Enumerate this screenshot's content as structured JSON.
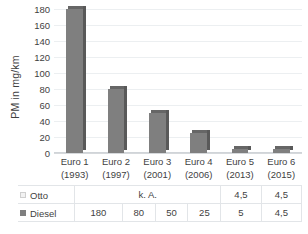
{
  "chart_data": {
    "type": "bar",
    "title": "",
    "subtitle": "",
    "xlabel": "",
    "ylabel": "PM in mg/km",
    "ylim": [
      0,
      180
    ],
    "ytick_step": 20,
    "yticks": [
      180,
      160,
      140,
      120,
      100,
      80,
      60,
      40,
      20,
      0
    ],
    "grid": true,
    "legend_position": "table-row-headers",
    "categories": [
      "Euro 1",
      "Euro 2",
      "Euro 3",
      "Euro 4",
      "Euro 5",
      "Euro 6"
    ],
    "category_years": [
      "(1993)",
      "(1997)",
      "(2001)",
      "(2006)",
      "(2013)",
      "(2015)"
    ],
    "series": [
      {
        "name": "Otto",
        "color": "#f2f2f2",
        "plotted": false,
        "values": [
          null,
          null,
          null,
          null,
          4.5,
          4.5
        ],
        "labels": [
          "k. A.",
          "k. A.",
          "k. A.",
          "k. A.",
          "4,5",
          "4,5"
        ],
        "unknown_label": "k. A.",
        "unknown_span": 4
      },
      {
        "name": "Diesel",
        "color": "#7f7f7f",
        "plotted": true,
        "values": [
          180,
          80,
          50,
          25,
          5,
          4.5
        ],
        "labels": [
          "180",
          "80",
          "50",
          "25",
          "5",
          "4,5"
        ]
      }
    ]
  },
  "axis": {
    "ylabel": "PM in mg/km",
    "ticks": [
      "180",
      "160",
      "140",
      "120",
      "100",
      "80",
      "60",
      "40",
      "20",
      "0"
    ]
  },
  "categories": [
    {
      "name": "Euro 1",
      "year": "(1993)"
    },
    {
      "name": "Euro 2",
      "year": "(1997)"
    },
    {
      "name": "Euro 3",
      "year": "(2001)"
    },
    {
      "name": "Euro 4",
      "year": "(2006)"
    },
    {
      "name": "Euro 5",
      "year": "(2013)"
    },
    {
      "name": "Euro 6",
      "year": "(2015)"
    }
  ],
  "table": {
    "otto": {
      "label": "Otto",
      "swatch": "legend-swatch-otto",
      "merged_label": "k. A.",
      "cells": [
        "4,5",
        "4,5"
      ]
    },
    "diesel": {
      "label": "Diesel",
      "swatch": "legend-swatch-diesel",
      "cells": [
        "180",
        "80",
        "50",
        "25",
        "5",
        "4,5"
      ]
    }
  },
  "colors": {
    "diesel_bar": "#7f7f7f",
    "diesel_bar_top": "#666666",
    "diesel_bar_side": "#595959",
    "otto_swatch": "#f2f2f2",
    "gridline": "#eceff1",
    "text": "#3f3f3f",
    "background": "#ffffff"
  }
}
